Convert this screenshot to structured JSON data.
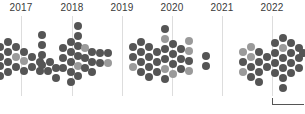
{
  "chart_data": {
    "type": "scatter",
    "title": "",
    "subtitle": "",
    "xlabel": "",
    "ylabel": "",
    "grid": true,
    "legend_position": "none",
    "axis": {
      "x_range": [
        2016.6,
        2022.7
      ],
      "x_ticks": [
        "2017",
        "2018",
        "2019",
        "2020",
        "2021",
        "2022"
      ],
      "x_tick_px": [
        21,
        72,
        122,
        172,
        222,
        272
      ],
      "y_range": [
        0,
        1
      ],
      "y_ticks": []
    },
    "colors": {
      "dark": "#555555",
      "light": "#9a9a9a",
      "gridline": "#dddddd",
      "label": "#3a3a3a",
      "scalebar": "#555555",
      "background": "#ffffff"
    },
    "series": [
      {
        "name": "dark",
        "color": "#555555",
        "count": 97
      },
      {
        "name": "light",
        "color": "#9a9a9a",
        "count": 20
      }
    ],
    "marker": {
      "shape": "circle",
      "diameter_px": 8
    },
    "annotations": [
      {
        "name": "scale-bar",
        "x_px": 272,
        "y_px": 104,
        "width_px": 32
      }
    ],
    "points": [
      {
        "x": 0,
        "y": 47,
        "c": "dark"
      },
      {
        "x": 0,
        "y": 57,
        "c": "dark"
      },
      {
        "x": 0,
        "y": 66,
        "c": "dark"
      },
      {
        "x": 0,
        "y": 76,
        "c": "dark"
      },
      {
        "x": 8,
        "y": 42,
        "c": "dark"
      },
      {
        "x": 8,
        "y": 52,
        "c": "dark"
      },
      {
        "x": 8,
        "y": 62,
        "c": "dark"
      },
      {
        "x": 8,
        "y": 72,
        "c": "dark"
      },
      {
        "x": 16,
        "y": 47,
        "c": "dark"
      },
      {
        "x": 16,
        "y": 57,
        "c": "light"
      },
      {
        "x": 16,
        "y": 67,
        "c": "dark"
      },
      {
        "x": 24,
        "y": 52,
        "c": "dark"
      },
      {
        "x": 24,
        "y": 61,
        "c": "light"
      },
      {
        "x": 24,
        "y": 71,
        "c": "dark"
      },
      {
        "x": 32,
        "y": 57,
        "c": "dark"
      },
      {
        "x": 32,
        "y": 67,
        "c": "dark"
      },
      {
        "x": 40,
        "y": 62,
        "c": "dark"
      },
      {
        "x": 40,
        "y": 71,
        "c": "dark"
      },
      {
        "x": 42,
        "y": 35,
        "c": "dark"
      },
      {
        "x": 42,
        "y": 45,
        "c": "dark"
      },
      {
        "x": 42,
        "y": 55,
        "c": "dark"
      },
      {
        "x": 42,
        "y": 65,
        "c": "dark"
      },
      {
        "x": 48,
        "y": 71,
        "c": "dark"
      },
      {
        "x": 50,
        "y": 62,
        "c": "dark"
      },
      {
        "x": 56,
        "y": 68,
        "c": "dark"
      },
      {
        "x": 56,
        "y": 78,
        "c": "dark"
      },
      {
        "x": 63,
        "y": 48,
        "c": "dark"
      },
      {
        "x": 63,
        "y": 58,
        "c": "dark"
      },
      {
        "x": 63,
        "y": 68,
        "c": "dark"
      },
      {
        "x": 71,
        "y": 42,
        "c": "dark"
      },
      {
        "x": 71,
        "y": 52,
        "c": "dark"
      },
      {
        "x": 71,
        "y": 62,
        "c": "dark"
      },
      {
        "x": 71,
        "y": 72,
        "c": "dark"
      },
      {
        "x": 71,
        "y": 82,
        "c": "dark"
      },
      {
        "x": 78,
        "y": 26,
        "c": "dark"
      },
      {
        "x": 78,
        "y": 36,
        "c": "dark"
      },
      {
        "x": 78,
        "y": 46,
        "c": "dark"
      },
      {
        "x": 78,
        "y": 56,
        "c": "dark"
      },
      {
        "x": 78,
        "y": 66,
        "c": "light"
      },
      {
        "x": 78,
        "y": 76,
        "c": "dark"
      },
      {
        "x": 85,
        "y": 48,
        "c": "light"
      },
      {
        "x": 85,
        "y": 58,
        "c": "dark"
      },
      {
        "x": 85,
        "y": 68,
        "c": "dark"
      },
      {
        "x": 92,
        "y": 52,
        "c": "dark"
      },
      {
        "x": 92,
        "y": 62,
        "c": "dark"
      },
      {
        "x": 92,
        "y": 72,
        "c": "dark"
      },
      {
        "x": 100,
        "y": 53,
        "c": "dark"
      },
      {
        "x": 100,
        "y": 63,
        "c": "dark"
      },
      {
        "x": 108,
        "y": 53,
        "c": "dark"
      },
      {
        "x": 108,
        "y": 63,
        "c": "light"
      },
      {
        "x": 133,
        "y": 47,
        "c": "dark"
      },
      {
        "x": 133,
        "y": 57,
        "c": "dark"
      },
      {
        "x": 133,
        "y": 67,
        "c": "light"
      },
      {
        "x": 141,
        "y": 42,
        "c": "dark"
      },
      {
        "x": 141,
        "y": 52,
        "c": "dark"
      },
      {
        "x": 141,
        "y": 62,
        "c": "dark"
      },
      {
        "x": 141,
        "y": 72,
        "c": "dark"
      },
      {
        "x": 149,
        "y": 47,
        "c": "dark"
      },
      {
        "x": 149,
        "y": 57,
        "c": "dark"
      },
      {
        "x": 149,
        "y": 67,
        "c": "dark"
      },
      {
        "x": 149,
        "y": 77,
        "c": "dark"
      },
      {
        "x": 157,
        "y": 52,
        "c": "dark"
      },
      {
        "x": 157,
        "y": 62,
        "c": "dark"
      },
      {
        "x": 157,
        "y": 72,
        "c": "dark"
      },
      {
        "x": 165,
        "y": 29,
        "c": "dark"
      },
      {
        "x": 165,
        "y": 39,
        "c": "light"
      },
      {
        "x": 165,
        "y": 49,
        "c": "dark"
      },
      {
        "x": 165,
        "y": 59,
        "c": "dark"
      },
      {
        "x": 165,
        "y": 69,
        "c": "light"
      },
      {
        "x": 165,
        "y": 79,
        "c": "dark"
      },
      {
        "x": 173,
        "y": 44,
        "c": "dark"
      },
      {
        "x": 173,
        "y": 54,
        "c": "dark"
      },
      {
        "x": 173,
        "y": 64,
        "c": "dark"
      },
      {
        "x": 173,
        "y": 74,
        "c": "light"
      },
      {
        "x": 181,
        "y": 49,
        "c": "dark"
      },
      {
        "x": 181,
        "y": 59,
        "c": "dark"
      },
      {
        "x": 181,
        "y": 69,
        "c": "dark"
      },
      {
        "x": 189,
        "y": 41,
        "c": "light"
      },
      {
        "x": 189,
        "y": 51,
        "c": "light"
      },
      {
        "x": 189,
        "y": 61,
        "c": "dark"
      },
      {
        "x": 189,
        "y": 71,
        "c": "light"
      },
      {
        "x": 206,
        "y": 56,
        "c": "dark"
      },
      {
        "x": 206,
        "y": 66,
        "c": "dark"
      },
      {
        "x": 243,
        "y": 52,
        "c": "light"
      },
      {
        "x": 243,
        "y": 62,
        "c": "dark"
      },
      {
        "x": 243,
        "y": 72,
        "c": "light"
      },
      {
        "x": 251,
        "y": 47,
        "c": "light"
      },
      {
        "x": 251,
        "y": 57,
        "c": "light"
      },
      {
        "x": 251,
        "y": 67,
        "c": "dark"
      },
      {
        "x": 251,
        "y": 77,
        "c": "dark"
      },
      {
        "x": 259,
        "y": 52,
        "c": "dark"
      },
      {
        "x": 259,
        "y": 62,
        "c": "dark"
      },
      {
        "x": 259,
        "y": 72,
        "c": "dark"
      },
      {
        "x": 259,
        "y": 82,
        "c": "dark"
      },
      {
        "x": 267,
        "y": 57,
        "c": "dark"
      },
      {
        "x": 267,
        "y": 67,
        "c": "dark"
      },
      {
        "x": 275,
        "y": 43,
        "c": "dark"
      },
      {
        "x": 275,
        "y": 53,
        "c": "dark"
      },
      {
        "x": 275,
        "y": 63,
        "c": "dark"
      },
      {
        "x": 275,
        "y": 73,
        "c": "dark"
      },
      {
        "x": 283,
        "y": 38,
        "c": "dark"
      },
      {
        "x": 283,
        "y": 48,
        "c": "light"
      },
      {
        "x": 283,
        "y": 58,
        "c": "dark"
      },
      {
        "x": 283,
        "y": 68,
        "c": "dark"
      },
      {
        "x": 283,
        "y": 78,
        "c": "dark"
      },
      {
        "x": 283,
        "y": 88,
        "c": "dark"
      },
      {
        "x": 291,
        "y": 43,
        "c": "dark"
      },
      {
        "x": 291,
        "y": 53,
        "c": "dark"
      },
      {
        "x": 291,
        "y": 63,
        "c": "dark"
      },
      {
        "x": 291,
        "y": 73,
        "c": "dark"
      },
      {
        "x": 299,
        "y": 48,
        "c": "dark"
      },
      {
        "x": 299,
        "y": 58,
        "c": "dark"
      },
      {
        "x": 299,
        "y": 68,
        "c": "dark"
      },
      {
        "x": 303,
        "y": 53,
        "c": "dark"
      }
    ]
  }
}
